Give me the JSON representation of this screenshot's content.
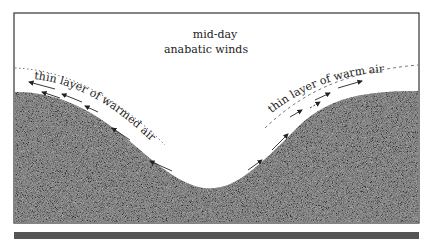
{
  "title": {
    "line1": "mid-day",
    "line2": "anabatic winds"
  },
  "labels": {
    "left": "thin layer of warmed air",
    "right": "thin layer of warm air"
  },
  "colors": {
    "ground": "#8a8a8a",
    "ink": "#222222",
    "background": "#ffffff"
  }
}
